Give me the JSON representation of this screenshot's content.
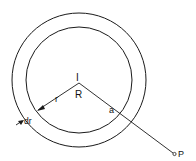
{
  "diagram": {
    "labels": {
      "center": "I",
      "region": "R",
      "radius": "r",
      "distance": "a",
      "thickness": "dr",
      "point": "P"
    },
    "colors": {
      "stroke": "#1a1a1a",
      "background": "#ffffff"
    }
  }
}
